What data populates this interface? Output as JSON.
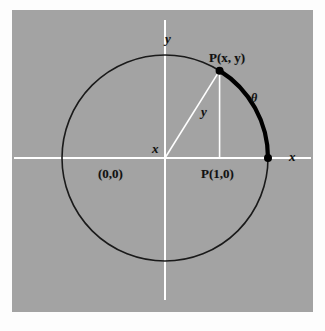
{
  "figure": {
    "background_color": "#a3a3a3",
    "page_color": "#fdfdfd",
    "axis_color": "#ffffff",
    "circle_color": "#1a1a1a",
    "arc_color": "#000000",
    "point_color": "#000000",
    "labels": {
      "y_axis": "y",
      "x_axis_right": "x",
      "origin": "(0,0)",
      "point_p_xy": "P(x, y)",
      "point_p_10": "P(1,0)",
      "theta": "θ",
      "leg_x": "x",
      "leg_y": "y"
    },
    "geometry": {
      "center_x": 153,
      "center_y": 148,
      "radius": 103,
      "point_angle_deg": 58,
      "arc_start_deg": 0,
      "arc_end_deg": 58
    }
  },
  "chart_data": {
    "type": "scatter",
    "xlabel": "x",
    "ylabel": "y",
    "xlim": [
      -1.45,
      1.45
    ],
    "ylim": [
      -1.4,
      1.4
    ],
    "grid": false,
    "legend": "none",
    "series": [
      {
        "name": "unit circle",
        "kind": "circle",
        "center": [
          0,
          0
        ],
        "radius": 1,
        "stroke": "#1a1a1a",
        "width": 1.5
      },
      {
        "name": "arc of measure theta",
        "kind": "arc",
        "center": [
          0,
          0
        ],
        "radius": 1,
        "start_deg": 0,
        "end_deg": 58,
        "stroke": "#000000",
        "width": 4
      },
      {
        "name": "radius to P",
        "kind": "segment",
        "from": [
          0,
          0
        ],
        "to": [
          0.53,
          0.85
        ],
        "stroke": "#ffffff"
      },
      {
        "name": "vertical leg y",
        "kind": "segment",
        "from": [
          0.53,
          0
        ],
        "to": [
          0.53,
          0.85
        ],
        "stroke": "#ffffff"
      },
      {
        "name": "x axis",
        "kind": "segment",
        "from": [
          -1.38,
          0
        ],
        "to": [
          1.38,
          0
        ],
        "stroke": "#ffffff"
      },
      {
        "name": "y axis",
        "kind": "segment",
        "from": [
          0,
          -1.33
        ],
        "to": [
          0,
          1.33
        ],
        "stroke": "#ffffff"
      }
    ],
    "points": [
      {
        "label": "P(x, y)",
        "x": 0.53,
        "y": 0.85
      },
      {
        "label": "P(1,0)",
        "x": 1,
        "y": 0
      }
    ],
    "annotations": [
      {
        "text": "y",
        "x": 0.0,
        "y": 1.28,
        "role": "y-axis-label"
      },
      {
        "text": "x",
        "x": 1.3,
        "y": 0.08,
        "role": "x-axis-label"
      },
      {
        "text": "(0,0)",
        "x": -0.17,
        "y": -0.15,
        "role": "origin-label"
      },
      {
        "text": "P(x, y)",
        "x": 0.62,
        "y": 0.98,
        "role": "point-label"
      },
      {
        "text": "P(1,0)",
        "x": 0.82,
        "y": -0.14,
        "role": "point-label"
      },
      {
        "text": "θ",
        "x": 1.08,
        "y": 0.52,
        "role": "angle-label"
      },
      {
        "text": "x",
        "x": 0.3,
        "y": 0.09,
        "role": "leg-label"
      },
      {
        "text": "y",
        "x": 0.61,
        "y": 0.42,
        "role": "leg-label"
      }
    ]
  },
  "label_positions": {
    "y_axis": {
      "left": 153,
      "top": 22
    },
    "x_axis_right": {
      "left": 277,
      "top": 140
    },
    "origin": {
      "left": 86,
      "top": 157
    },
    "point_p_xy": {
      "left": 197,
      "top": 41
    },
    "point_p_10": {
      "left": 189,
      "top": 157
    },
    "theta": {
      "left": 239,
      "top": 82
    },
    "leg_x": {
      "left": 140,
      "top": 132
    },
    "leg_y": {
      "left": 189,
      "top": 95
    }
  }
}
